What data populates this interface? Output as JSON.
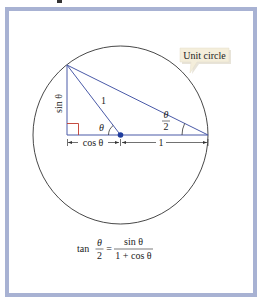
{
  "figure": {
    "callout": {
      "label": "Unit circle"
    },
    "labels": {
      "hypotenuse": "1",
      "theta": "θ",
      "sin_theta": "sin θ",
      "half_angle_num": "θ",
      "half_angle_den": "2",
      "cos_theta": "cos θ",
      "radius_one": "1"
    },
    "formula": {
      "lhs_fn": "tan",
      "lhs_num": "θ",
      "lhs_den": "2",
      "equals": "=",
      "rhs_num": "sin θ",
      "rhs_den": "1 + cos θ"
    },
    "colors": {
      "frame_border": "#a8b2d3",
      "triangle_lines": "#4a5aa8",
      "circle": "#333333",
      "right_angle": "#c0392b",
      "center_dot": "#1f3d9e",
      "callout_fill": "#f4eedb",
      "callout_shadow": "#d8d2bf"
    },
    "geometry": {
      "circle_center": [
        120.5,
        135
      ],
      "radius_px": 88,
      "apex": [
        67,
        65
      ],
      "right_end": [
        208,
        135
      ],
      "foot": [
        67,
        135
      ]
    }
  }
}
